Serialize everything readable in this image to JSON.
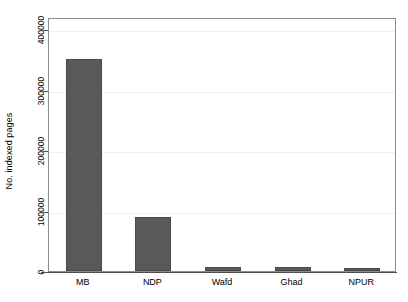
{
  "chart_data": {
    "type": "bar",
    "title": "",
    "subtitle": "",
    "xlabel": "",
    "ylabel": "No. indexed pages",
    "categories": [
      "MB",
      "NDP",
      "Wafd",
      "Ghad",
      "NPUR"
    ],
    "values": [
      350000,
      90000,
      7000,
      6500,
      3500
    ],
    "series": [
      {
        "name": "No. indexed pages",
        "values": [
          350000,
          90000,
          7000,
          6500,
          3500
        ]
      }
    ],
    "ylim": [
      0,
      420000
    ],
    "yticks": [
      0,
      100000,
      200000,
      300000,
      400000
    ],
    "ytick_labels": [
      "0",
      "100000",
      "200000",
      "300000",
      "400000"
    ],
    "grid": true,
    "grid_axis": "y",
    "legend": false,
    "legend_position": "none",
    "bar_color": "#595959",
    "bar_edge_color": "#4a4a4a",
    "gridline_color": "#eeeeee",
    "frame_color": "#8c8c8c",
    "axis_color": "#4d4d4d",
    "background_color": "#ffffff"
  }
}
